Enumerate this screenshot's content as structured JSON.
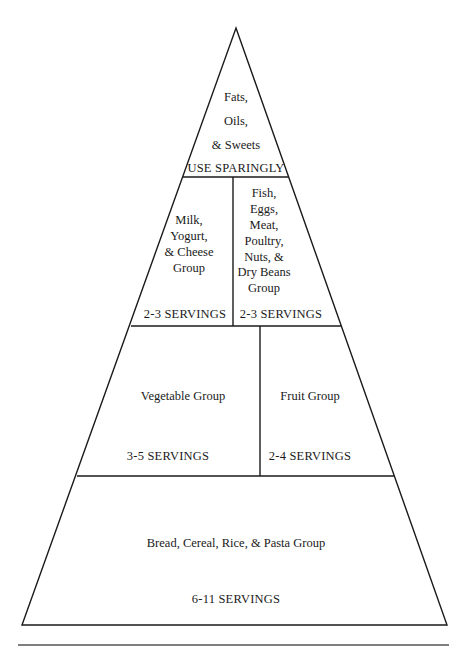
{
  "pyramid": {
    "title": "Food Guide Pyramid",
    "colors": {
      "line": "#1a1a1a",
      "background": "#ffffff",
      "separator": "#555555"
    },
    "tiers": [
      {
        "id": "top",
        "groups": [
          {
            "name_lines": [
              "Fats,",
              "Oils,",
              "& Sweets"
            ],
            "servings": "USE SPARINGLY"
          }
        ]
      },
      {
        "id": "second",
        "groups": [
          {
            "name_lines": [
              "Milk,",
              "Yogurt,",
              "& Cheese",
              "Group"
            ],
            "servings": "2-3 SERVINGS"
          },
          {
            "name_lines": [
              "Fish,",
              "Eggs,",
              "Meat,",
              "Poultry,",
              "Nuts, &",
              "Dry Beans",
              "Group"
            ],
            "servings": "2-3 SERVINGS"
          }
        ]
      },
      {
        "id": "third",
        "groups": [
          {
            "name_lines": [
              "Vegetable Group"
            ],
            "servings": "3-5 SERVINGS"
          },
          {
            "name_lines": [
              "Fruit Group"
            ],
            "servings": "2-4 SERVINGS"
          }
        ]
      },
      {
        "id": "base",
        "groups": [
          {
            "name_lines": [
              "Bread, Cereal, Rice, & Pasta Group"
            ],
            "servings": "6-11 SERVINGS"
          }
        ]
      }
    ]
  }
}
